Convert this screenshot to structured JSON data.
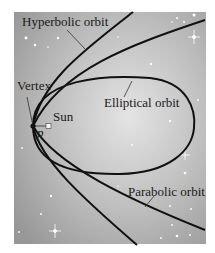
{
  "figure": {
    "labels": {
      "hyperbolic": "Hyperbolic orbit",
      "elliptical": "Elliptical orbit",
      "parabolic": "Parabolic orbit",
      "vertex": "Vertex",
      "sun": "Sun",
      "p": "p"
    },
    "colors": {
      "background_center": "#e2e2e2",
      "background_edge": "#9a9a9a",
      "curve": "#111111",
      "star": "#ffffff"
    }
  }
}
